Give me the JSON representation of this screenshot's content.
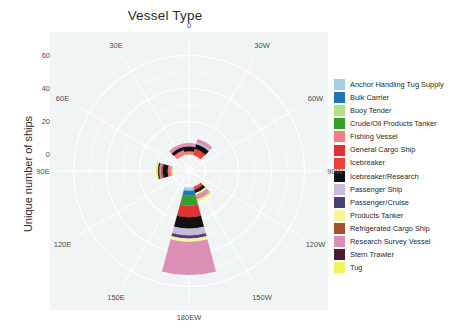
{
  "chart_data": {
    "type": "bar",
    "subtype": "polar-stacked-coxcomb",
    "title": "Vessel Type",
    "xlabel": "",
    "ylabel": "Unique number of ships",
    "ylim": [
      -10,
      70
    ],
    "yticks": [
      "0",
      "20",
      "40",
      "60"
    ],
    "ytick_values": [
      0,
      20,
      40,
      60
    ],
    "grid": true,
    "legend_position": "right",
    "legend_title": "",
    "angular_axis": {
      "name": "longitude",
      "tick_labels": [
        "0",
        "30W",
        "60W",
        "90W",
        "120W",
        "150W",
        "180EW",
        "150E",
        "120E",
        "90E",
        "60E",
        "30E"
      ],
      "tick_degrees": [
        0,
        30,
        60,
        90,
        120,
        150,
        180,
        210,
        240,
        270,
        300,
        330
      ]
    },
    "categories": [
      "0",
      "30W",
      "60W",
      "90W",
      "120W",
      "150W",
      "180EW",
      "150E",
      "120E",
      "90E",
      "60E",
      "30E"
    ],
    "series": [
      {
        "name": "Anchor Handling Tug Supply",
        "color": "#a6cee3",
        "values": [
          0,
          0,
          0,
          0,
          0,
          0,
          2,
          0,
          0,
          0,
          0,
          0
        ]
      },
      {
        "name": "Bulk Carrier",
        "color": "#1f78b4",
        "values": [
          0,
          0,
          0,
          0,
          0,
          0,
          3,
          0,
          0,
          0,
          0,
          0
        ]
      },
      {
        "name": "Buoy Tender",
        "color": "#b2df8a",
        "values": [
          0,
          0,
          0,
          0,
          0,
          0,
          0,
          0,
          0,
          1,
          0,
          0
        ]
      },
      {
        "name": "Crude/Oil Products Tanker",
        "color": "#33a02c",
        "values": [
          0,
          0,
          0,
          0,
          0,
          0,
          6,
          0,
          0,
          0,
          0,
          0
        ]
      },
      {
        "name": "Fishing Vessel",
        "color": "#f08181",
        "values": [
          2,
          0,
          0,
          0,
          0,
          0,
          0,
          0,
          0,
          2,
          0,
          3
        ]
      },
      {
        "name": "General Cargo Ship",
        "color": "#e03434",
        "values": [
          0,
          0,
          0,
          0,
          0,
          0,
          7,
          0,
          0,
          0,
          0,
          0
        ]
      },
      {
        "name": "Icebreaker",
        "color": "#ef4037",
        "values": [
          0,
          4,
          0,
          0,
          0,
          2,
          0,
          0,
          0,
          0,
          0,
          0
        ]
      },
      {
        "name": "Icebreaker/Research",
        "color": "#121212",
        "values": [
          3,
          3,
          0,
          0,
          0,
          2,
          7,
          0,
          0,
          3,
          0,
          2
        ]
      },
      {
        "name": "Passenger Ship",
        "color": "#c6bcd6",
        "values": [
          0,
          1,
          0,
          0,
          0,
          0,
          4,
          0,
          0,
          0,
          0,
          0
        ]
      },
      {
        "name": "Passenger/Cruise",
        "color": "#4d3f7a",
        "values": [
          0,
          0,
          0,
          0,
          0,
          0,
          2,
          0,
          0,
          0,
          0,
          0
        ]
      },
      {
        "name": "Products Tanker",
        "color": "#f5f5a0",
        "values": [
          0,
          0,
          0,
          0,
          0,
          1,
          2,
          0,
          0,
          0,
          0,
          0
        ]
      },
      {
        "name": "Refrigerated Cargo Ship",
        "color": "#a0522d",
        "values": [
          0,
          0,
          0,
          0,
          0,
          0,
          0,
          0,
          0,
          1,
          0,
          0
        ]
      },
      {
        "name": "Research Survey Vessel",
        "color": "#dc8fb5",
        "values": [
          2,
          2,
          0,
          0,
          0,
          3,
          20,
          0,
          0,
          1,
          0,
          2
        ]
      },
      {
        "name": "Stern Trawler",
        "color": "#4a1f2b",
        "values": [
          0,
          0,
          0,
          0,
          0,
          0,
          0,
          0,
          0,
          1,
          0,
          0
        ]
      },
      {
        "name": "Tug",
        "color": "#f2f25c",
        "values": [
          0,
          0,
          0,
          0,
          0,
          1,
          0,
          0,
          0,
          1,
          0,
          0
        ]
      }
    ]
  },
  "legend": {
    "items": [
      {
        "label": "Anchor Handling Tug Supply",
        "color": "#a6cee3"
      },
      {
        "label": "Bulk Carrier",
        "color": "#1f78b4"
      },
      {
        "label": "Buoy Tender",
        "color": "#b2df8a"
      },
      {
        "label": "Crude/Oil Products Tanker",
        "color": "#33a02c"
      },
      {
        "label": "Fishing Vessel",
        "color": "#f08181"
      },
      {
        "label": "General Cargo Ship",
        "color": "#e03434"
      },
      {
        "label": "Icebreaker",
        "color": "#ef4037"
      },
      {
        "label": "Icebreaker/Research",
        "color": "#121212"
      },
      {
        "label": "Passenger Ship",
        "color": "#c6bcd6"
      },
      {
        "label": "Passenger/Cruise",
        "color": "#4d3f7a"
      },
      {
        "label": "Products Tanker",
        "color": "#f5f5a0"
      },
      {
        "label": "Refrigerated Cargo Ship",
        "color": "#a0522d"
      },
      {
        "label": "Research Survey Vessel",
        "color": "#dc8fb5"
      },
      {
        "label": "Stern Trawler",
        "color": "#4a1f2b"
      },
      {
        "label": "Tug",
        "color": "#f2f25c"
      }
    ]
  },
  "theme": {
    "panel_bg": "#f1f4f5",
    "grid_color": "#ffffff",
    "text_color": "#4d4d4d",
    "title_color": "#2b2b2b",
    "page_bg": "#ffffff"
  }
}
